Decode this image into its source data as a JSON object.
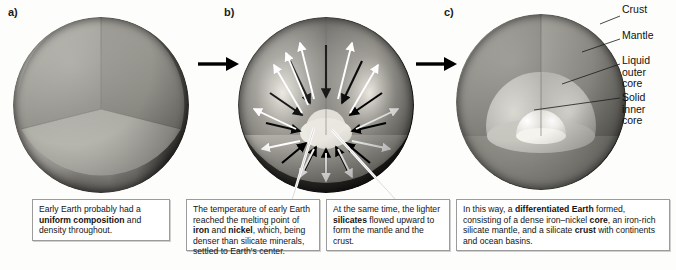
{
  "figure": {
    "background": "#fdfdfc"
  },
  "panels": [
    {
      "id": "a",
      "letter": "a)"
    },
    {
      "id": "b",
      "letter": "b)"
    },
    {
      "id": "c",
      "letter": "c)"
    }
  ],
  "transitions": [
    {
      "name": "arrow-a-to-b",
      "glyph": "→"
    },
    {
      "name": "arrow-b-to-c",
      "glyph": "→"
    }
  ],
  "layer_labels": [
    {
      "key": "crust",
      "text": "Crust"
    },
    {
      "key": "mantle",
      "text": "Mantle"
    },
    {
      "key": "outer_core",
      "text": "Liquid\nouter\ncore"
    },
    {
      "key": "inner_core",
      "text": "Solid\ninner\ncore"
    }
  ],
  "captions": [
    {
      "key": "caption_a",
      "panel": "a",
      "runs": [
        {
          "text": "Early Earth probably had ",
          "bold": false
        },
        {
          "text": "a ",
          "bold": false
        },
        {
          "text": "uniform composition",
          "bold": true
        },
        {
          "text": " and density throughout.",
          "bold": false
        }
      ],
      "plain": "Early Earth probably had a uniform composition and density throughout."
    },
    {
      "key": "caption_b1",
      "panel": "b",
      "runs": [
        {
          "text": "The temperature of early Earth reached the melting point of ",
          "bold": false
        },
        {
          "text": "iron",
          "bold": true
        },
        {
          "text": " and ",
          "bold": false
        },
        {
          "text": "nickel",
          "bold": true
        },
        {
          "text": ", which, being denser than silicate minerals, settled to Earth's center.",
          "bold": false
        }
      ],
      "plain": "The temperature of early Earth reached the melting point of iron and nickel, which, being denser than silicate minerals, settled to Earth's center."
    },
    {
      "key": "caption_b2",
      "panel": "b",
      "runs": [
        {
          "text": "At the same time, the lighter ",
          "bold": false
        },
        {
          "text": "silicates",
          "bold": true
        },
        {
          "text": " flowed upward to form the mantle and the crust.",
          "bold": false
        }
      ],
      "plain": "At the same time, the lighter silicates flowed upward to form the mantle and the crust."
    },
    {
      "key": "caption_c",
      "panel": "c",
      "runs": [
        {
          "text": "In this way, a ",
          "bold": false
        },
        {
          "text": "differentiated Earth",
          "bold": true
        },
        {
          "text": " formed, consisting of a dense iron–nickel ",
          "bold": false
        },
        {
          "text": "core",
          "bold": true
        },
        {
          "text": ", an iron-rich silicate mantle, and a silicate ",
          "bold": false
        },
        {
          "text": "crust",
          "bold": true
        },
        {
          "text": " with continents and ocean basins.",
          "bold": false
        }
      ],
      "plain": "In this way, a differentiated Earth formed, consisting of a dense iron–nickel core, an iron-rich silicate mantle, and a silicate crust with continents and ocean basins."
    }
  ],
  "flow_arrows": {
    "sinking": {
      "name": "iron-nickel-sinking-arrows",
      "color": "#000000",
      "direction": "inward",
      "count": 12
    },
    "rising": {
      "name": "silicate-rising-arrows",
      "color": "#ffffff",
      "direction": "outward",
      "count": 12
    }
  },
  "colors": {
    "interior_uniform": "#9b9b93",
    "mantle": "#8d8d86",
    "outer_core": "#c3c2bb",
    "inner_core": "#efeee8",
    "crust_line": "#2a2a28",
    "box_border": "#9b9b9b"
  }
}
